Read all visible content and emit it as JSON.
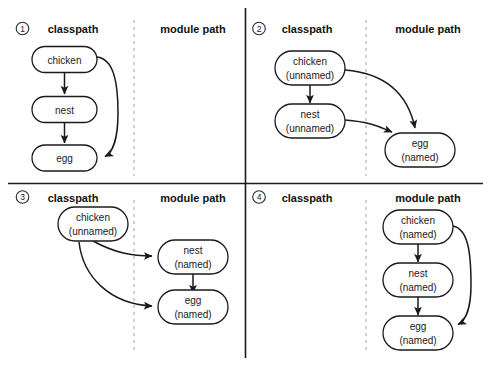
{
  "figure": {
    "column_headers": {
      "classpath": "classpath",
      "module_path": "module path"
    },
    "node_labels": {
      "chicken": "chicken",
      "nest": "nest",
      "egg": "egg",
      "unnamed": "(unnamed)",
      "named": "(named)"
    },
    "colors": {
      "background": "#ffffff",
      "stroke": "#1a1a1a",
      "divider": "#1a1a1a",
      "dashed": "#a8a8a8"
    }
  },
  "quadrants": [
    {
      "number": "1",
      "classpath_header": "classpath",
      "module_path_header": "module path",
      "nodes": [
        {
          "id": "chicken",
          "line1": "chicken",
          "line2": "",
          "side": "classpath"
        },
        {
          "id": "nest",
          "line1": "nest",
          "line2": "",
          "side": "classpath"
        },
        {
          "id": "egg",
          "line1": "egg",
          "line2": "",
          "side": "classpath"
        }
      ],
      "edges": [
        {
          "from": "chicken",
          "to": "nest",
          "style": "straight"
        },
        {
          "from": "nest",
          "to": "egg",
          "style": "straight"
        },
        {
          "from": "chicken",
          "to": "egg",
          "style": "curved"
        }
      ]
    },
    {
      "number": "2",
      "classpath_header": "classpath",
      "module_path_header": "module path",
      "nodes": [
        {
          "id": "chicken",
          "line1": "chicken",
          "line2": "(unnamed)",
          "side": "classpath"
        },
        {
          "id": "nest",
          "line1": "nest",
          "line2": "(unnamed)",
          "side": "classpath"
        },
        {
          "id": "egg",
          "line1": "egg",
          "line2": "(named)",
          "side": "module_path"
        }
      ],
      "edges": [
        {
          "from": "chicken",
          "to": "nest",
          "style": "straight"
        },
        {
          "from": "chicken",
          "to": "egg",
          "style": "curved"
        },
        {
          "from": "nest",
          "to": "egg",
          "style": "curved"
        }
      ]
    },
    {
      "number": "3",
      "classpath_header": "classpath",
      "module_path_header": "module path",
      "nodes": [
        {
          "id": "chicken",
          "line1": "chicken",
          "line2": "(unnamed)",
          "side": "classpath"
        },
        {
          "id": "nest",
          "line1": "nest",
          "line2": "(named)",
          "side": "module_path"
        },
        {
          "id": "egg",
          "line1": "egg",
          "line2": "(named)",
          "side": "module_path"
        }
      ],
      "edges": [
        {
          "from": "chicken",
          "to": "nest",
          "style": "curved"
        },
        {
          "from": "chicken",
          "to": "egg",
          "style": "curved"
        },
        {
          "from": "nest",
          "to": "egg",
          "style": "straight"
        }
      ]
    },
    {
      "number": "4",
      "classpath_header": "classpath",
      "module_path_header": "module path",
      "nodes": [
        {
          "id": "chicken",
          "line1": "chicken",
          "line2": "(named)",
          "side": "module_path"
        },
        {
          "id": "nest",
          "line1": "nest",
          "line2": "(named)",
          "side": "module_path"
        },
        {
          "id": "egg",
          "line1": "egg",
          "line2": "(named)",
          "side": "module_path"
        }
      ],
      "edges": [
        {
          "from": "chicken",
          "to": "nest",
          "style": "straight"
        },
        {
          "from": "nest",
          "to": "egg",
          "style": "straight"
        },
        {
          "from": "chicken",
          "to": "egg",
          "style": "curved"
        }
      ]
    }
  ]
}
